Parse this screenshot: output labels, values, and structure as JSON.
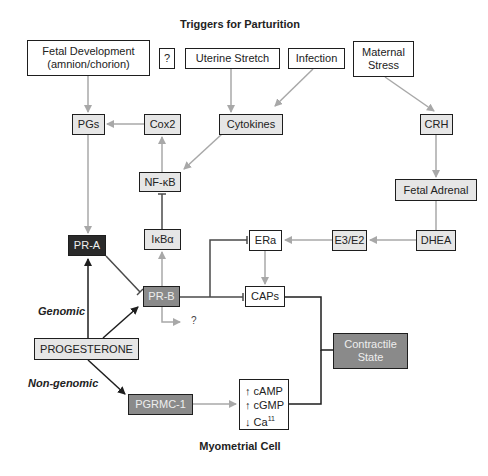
{
  "title": "Triggers for Parturition",
  "footer": "Myometrial Cell",
  "triggers": {
    "fetal_development": [
      "Fetal Development",
      "(amnion/chorion)"
    ],
    "unknown": "?",
    "uterine_stretch": "Uterine Stretch",
    "infection": "Infection",
    "maternal_stress": [
      "Maternal",
      "Stress"
    ]
  },
  "nodes": {
    "pgs": "PGs",
    "cox2": "Cox2",
    "cytokines": "Cytokines",
    "crh": "CRH",
    "nfkb": "NF-κB",
    "fetal_adrenal": "Fetal Adrenal",
    "ikba": "IκBα",
    "era": "ERa",
    "e3e2": "E3/E2",
    "dhea": "DHEA",
    "pra": "PR-A",
    "prb": "PR-B",
    "caps": "CAPs",
    "progesterone": "PROGESTERONE",
    "contractile_state": [
      "Contractile",
      "State"
    ],
    "pgrmc1": "PGRMC-1",
    "prb_unknown": "?"
  },
  "second_messengers": [
    {
      "arrow": "↑",
      "label": "cAMP",
      "sup": ""
    },
    {
      "arrow": "↑",
      "label": "cGMP",
      "sup": ""
    },
    {
      "arrow": "↓",
      "label": "Ca",
      "sup": "11"
    }
  ],
  "pathway_labels": {
    "genomic": "Genomic",
    "non_genomic": "Non-genomic"
  },
  "colors": {
    "gray_arrow": "#a8a8a8",
    "black_arrow": "#1e1e1e",
    "light_box": "#e6e6e6",
    "dark_box": "#2a2a2a",
    "mid_box": "#8a8a8a"
  }
}
